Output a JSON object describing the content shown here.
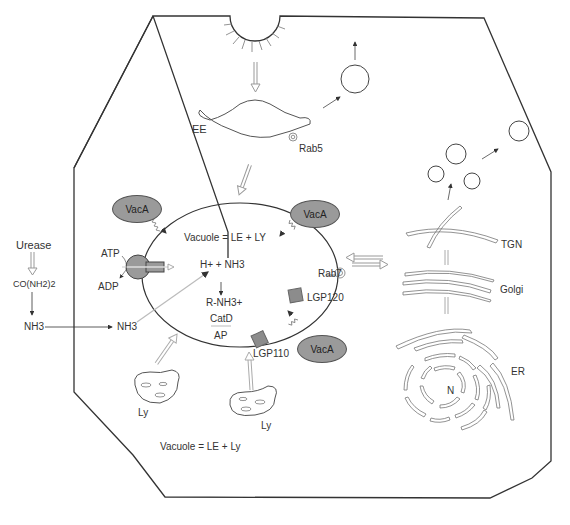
{
  "diagram": {
    "labels": {
      "ee": "EE",
      "rab5": "Rab5",
      "rab7": "Rab7",
      "urease": "Urease",
      "urea": "CO(NH2)2",
      "nh3_outside": "NH3",
      "nh3_inside": "NH3",
      "atp": "ATP",
      "adp": "ADP",
      "vacuole_inner": "Vacuole = LE + LY",
      "h_nh3": "H+ + NH3",
      "rnh3": "R-NH3+",
      "catd": "CatD",
      "ap": "AP",
      "lgp120": "LGP120",
      "lgp110": "LGP110",
      "ly_left": "Ly",
      "ly_right": "Ly",
      "vacuole_bottom": "Vacuole = LE + Ly",
      "tgn": "TGN",
      "golgi": "Golgi",
      "er": "ER",
      "nucleus": "N"
    },
    "vaca": [
      "VacA",
      "VacA",
      "VacA"
    ],
    "colors": {
      "line": "#333333",
      "vaca_fill": "#9a9a9a",
      "protein_fill": "#8c8c8c",
      "hollow_arrow": "#888888"
    }
  }
}
